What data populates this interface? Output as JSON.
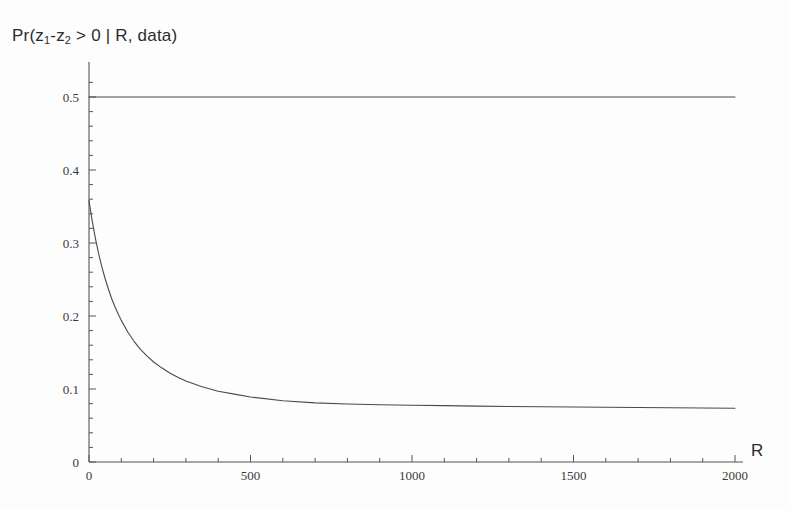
{
  "figure": {
    "title": "Pr(z1-z2 > 0 | R, data)",
    "title_parts": {
      "prefix": "Pr(z",
      "sub1": "1",
      "mid": "-z",
      "sub2": "2",
      "suffix": " > 0 | R, data)"
    },
    "background_color": "#fdfdfd",
    "axis_color": "#555555",
    "curve_color": "#4a4a4a"
  },
  "chart_data": {
    "type": "line",
    "title": "Pr(z1-z2 > 0 | R, data)",
    "xlabel": "R",
    "ylabel": "",
    "xlim": [
      0,
      2000
    ],
    "ylim": [
      0,
      0.528
    ],
    "grid": false,
    "legend": "none",
    "x_ticks": [
      0,
      500,
      1000,
      1500,
      2000
    ],
    "x_tick_labels": [
      "0",
      "500",
      "1000",
      "1500",
      "2000"
    ],
    "x_minor_step": 100,
    "y_ticks": [
      0,
      0.1,
      0.2,
      0.3,
      0.4,
      0.5
    ],
    "y_tick_labels": [
      "0",
      "0.1",
      "0.2",
      "0.3",
      "0.4",
      "0.5"
    ],
    "y_minor_step": 0.02,
    "series": [
      {
        "name": "reference-line",
        "style": "solid",
        "x": [
          0,
          2000
        ],
        "values": [
          0.5,
          0.5
        ]
      },
      {
        "name": "posterior-probability",
        "style": "solid",
        "x": [
          0,
          10,
          20,
          30,
          40,
          50,
          60,
          70,
          80,
          90,
          100,
          120,
          140,
          160,
          180,
          200,
          225,
          250,
          275,
          300,
          350,
          400,
          450,
          500,
          600,
          700,
          800,
          900,
          1000,
          1100,
          1200,
          1300,
          1400,
          1500,
          1600,
          1700,
          1800,
          1900,
          2000
        ],
        "values": [
          0.358,
          0.33,
          0.306,
          0.285,
          0.267,
          0.251,
          0.237,
          0.224,
          0.213,
          0.203,
          0.194,
          0.178,
          0.165,
          0.154,
          0.145,
          0.137,
          0.129,
          0.122,
          0.116,
          0.111,
          0.103,
          0.097,
          0.093,
          0.089,
          0.084,
          0.081,
          0.0795,
          0.0785,
          0.0778,
          0.0772,
          0.0766,
          0.0761,
          0.0757,
          0.0753,
          0.0749,
          0.0746,
          0.0743,
          0.074,
          0.0737
        ]
      }
    ]
  },
  "axis_labels": {
    "x_axis_name": "R"
  }
}
